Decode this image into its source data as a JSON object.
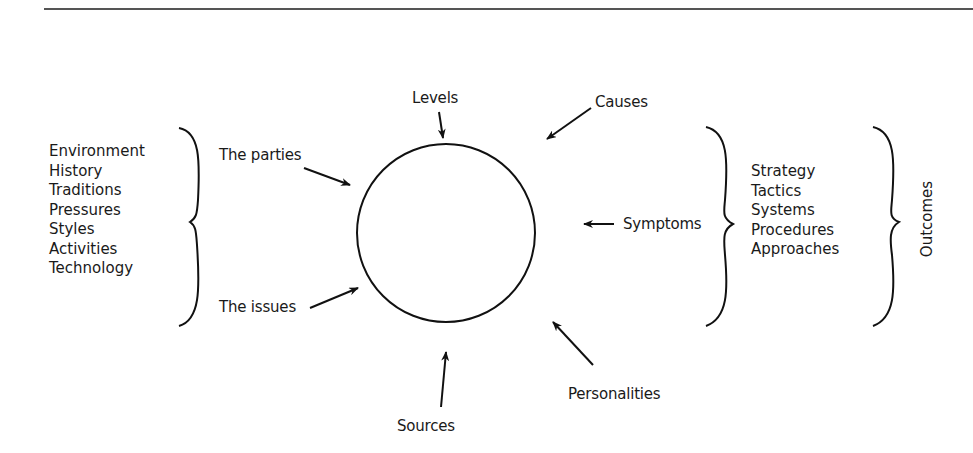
{
  "diagram": {
    "center_node": {
      "shape": "circle",
      "label": ""
    },
    "inputs": {
      "top": "Levels",
      "top_right": "Causes",
      "left_upper": "The parties",
      "left_lower": "The issues",
      "right": "Symptoms",
      "bottom_right": "Personalities",
      "bottom": "Sources"
    },
    "left_factors": [
      "Environment",
      "History",
      "Traditions",
      "Pressures",
      "Styles",
      "Activities",
      "Technology"
    ],
    "right_responses": [
      "Strategy",
      "Tactics",
      "Systems",
      "Procedures",
      "Approaches"
    ],
    "outcome_label": "Outcomes"
  }
}
